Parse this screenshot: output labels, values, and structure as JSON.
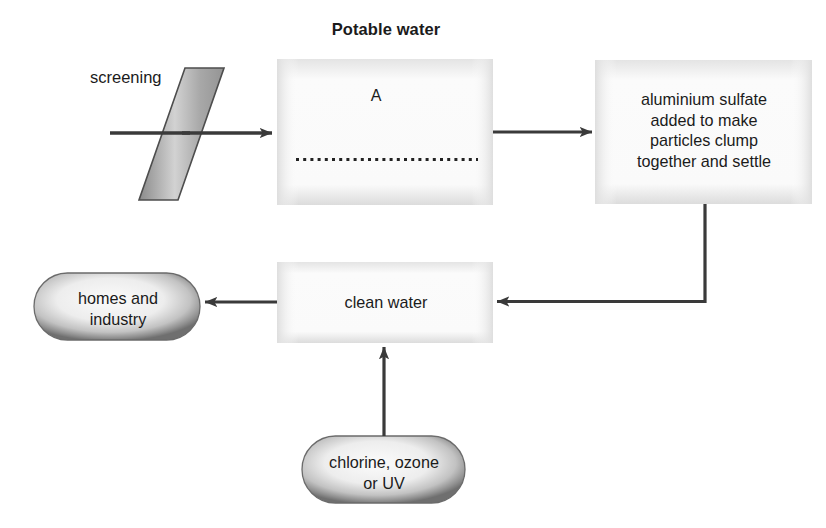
{
  "diagram": {
    "title": "Potable water",
    "type": "process-flowchart",
    "background_color": "#ffffff",
    "line_color": "#3a3a3a",
    "text_color": "#1b1b1b",
    "nodes": {
      "screening": {
        "label": "screening",
        "shape": "parallelogram",
        "fill_colors": [
          "#8f8f8f",
          "#cfcfcf",
          "#9a9a9a"
        ],
        "stroke": "#4a4a4a"
      },
      "box_a": {
        "label": "A",
        "shape": "rectangle",
        "fill": "#f7f7f7",
        "inner_feature": "dotted-line"
      },
      "aluminium_sulfate": {
        "label": "aluminium sulfate\nadded to make\nparticles clump\ntogether and settle",
        "shape": "rectangle",
        "fill": "#f5f5f5"
      },
      "clean_water": {
        "label": "clean water",
        "shape": "rectangle",
        "fill": "#f5f5f5"
      },
      "homes_and_industry": {
        "label": "homes and\nindustry",
        "shape": "stadium-ellipse",
        "fill": "#e9e9e9",
        "edge_shade": "#7d7d7d"
      },
      "chlorine_ozone_uv": {
        "label": "chlorine, ozone\nor UV",
        "shape": "stadium-ellipse",
        "fill": "#e9e9e9",
        "edge_shade": "#7d7d7d"
      }
    },
    "edges": [
      {
        "from": "water-inlet",
        "to": "screening",
        "direction": "right"
      },
      {
        "from": "screening",
        "to": "box_a",
        "direction": "right"
      },
      {
        "from": "box_a",
        "to": "aluminium_sulfate",
        "direction": "right"
      },
      {
        "from": "aluminium_sulfate",
        "to": "clean_water",
        "direction": "down-then-left"
      },
      {
        "from": "clean_water",
        "to": "homes_and_industry",
        "direction": "left"
      },
      {
        "from": "chlorine_ozone_uv",
        "to": "clean_water",
        "direction": "up"
      }
    ]
  }
}
